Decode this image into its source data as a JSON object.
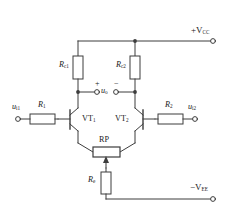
{
  "diagram": {
    "line_color": "#3d3d3d",
    "text_color": "#1a1a1a",
    "background": "#ffffff"
  },
  "supplies": {
    "positive": {
      "label": "+V",
      "sub": "CC",
      "terminal": "open-circle"
    },
    "negative": {
      "label": "−V",
      "sub": "EE",
      "terminal": "open-circle"
    }
  },
  "inputs": {
    "left": {
      "label": "u",
      "sub": "i1",
      "terminal": "open-circle"
    },
    "right": {
      "label": "u",
      "sub": "i2",
      "terminal": "open-circle"
    }
  },
  "output": {
    "label": "u",
    "sub": "o",
    "plus": "+",
    "minus": "−",
    "terminals": "open-circle-pair"
  },
  "components": [
    {
      "name": "Rc1",
      "label": "R",
      "sub": "c1",
      "type": "resistor",
      "orientation": "vertical"
    },
    {
      "name": "Rc2",
      "label": "R",
      "sub": "c2",
      "type": "resistor",
      "orientation": "vertical"
    },
    {
      "name": "R1",
      "label": "R",
      "sub": "1",
      "type": "resistor",
      "orientation": "horizontal"
    },
    {
      "name": "R2",
      "label": "R",
      "sub": "2",
      "type": "resistor",
      "orientation": "horizontal"
    },
    {
      "name": "RP",
      "label": "RP",
      "sub": "",
      "type": "potentiometer",
      "orientation": "horizontal"
    },
    {
      "name": "Re",
      "label": "R",
      "sub": "e",
      "type": "resistor",
      "orientation": "vertical"
    },
    {
      "name": "VT1",
      "label": "VT",
      "sub": "1",
      "type": "npn-transistor",
      "facing": "right"
    },
    {
      "name": "VT2",
      "label": "VT",
      "sub": "2",
      "type": "npn-transistor",
      "facing": "left"
    }
  ]
}
